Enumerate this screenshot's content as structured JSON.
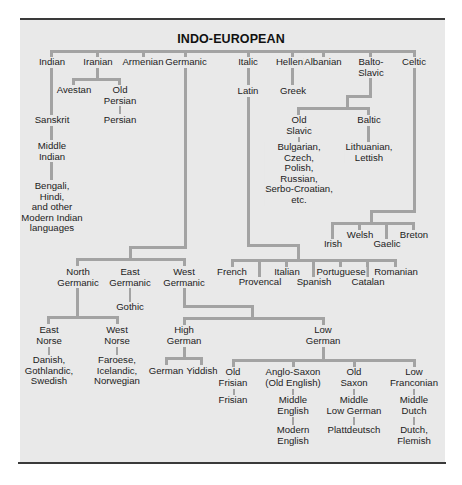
{
  "title": "INDO-EUROPEAN",
  "colors": {
    "background": "#e9e9e9",
    "line": "#a3a3a3",
    "border": "#3a3a3a",
    "text": "#1c1c1c"
  },
  "tree": {
    "indian": {
      "label": "Indian",
      "sanskrit": "Sanskrit",
      "middle_indian": [
        "Middle",
        "Indian"
      ],
      "modern": [
        "Bengali,",
        "Hindi,",
        "and other",
        "Modern Indian",
        "languages"
      ]
    },
    "iranian": {
      "label": "Iranian",
      "avestan": "Avestan",
      "old_persian": [
        "Old",
        "Persian"
      ],
      "persian": "Persian"
    },
    "armenian": {
      "label": "Armenian"
    },
    "germanic": {
      "label": "Germanic",
      "north": {
        "label": [
          "North",
          "Germanic"
        ],
        "east_norse": {
          "label": [
            "East",
            "Norse"
          ],
          "children": [
            "Danish,",
            "Gothlandic,",
            "Swedish"
          ]
        },
        "west_norse": {
          "label": [
            "West",
            "Norse"
          ],
          "children": [
            "Faroese,",
            "Icelandic,",
            "Norwegian"
          ]
        }
      },
      "east": {
        "label": [
          "East",
          "Germanic"
        ],
        "gothic": "Gothic"
      },
      "west": {
        "label": [
          "West",
          "Germanic"
        ],
        "high_german": {
          "label": [
            "High",
            "German"
          ],
          "children": [
            "German",
            "Yiddish"
          ]
        },
        "low_german": {
          "label": [
            "Low",
            "German"
          ],
          "old_frisian": {
            "label": [
              "Old",
              "Frisian"
            ],
            "child": "Frisian"
          },
          "anglo_saxon": {
            "label": [
              "Anglo-Saxon",
              "(Old English)"
            ],
            "middle": [
              "Middle",
              "English"
            ],
            "modern": [
              "Modern",
              "English"
            ]
          },
          "old_saxon": {
            "label": [
              "Old",
              "Saxon"
            ],
            "middle": [
              "Middle",
              "Low German"
            ],
            "modern": "Plattdeutsch"
          },
          "low_franconian": {
            "label": [
              "Low",
              "Franconian"
            ],
            "middle": [
              "Middle",
              "Dutch"
            ],
            "modern": [
              "Dutch,",
              "Flemish"
            ]
          }
        }
      }
    },
    "italic": {
      "label": "Italic",
      "latin": "Latin",
      "romance": [
        "French",
        "Provencal",
        "Italian",
        "Spanish",
        "Portuguese",
        "Catalan",
        "Romanian"
      ]
    },
    "hellenic": {
      "label": "Hellenic",
      "greek": "Greek"
    },
    "albanian": {
      "label": "Albanian"
    },
    "balto_slavic": {
      "label": [
        "Balto-",
        "Slavic"
      ],
      "old_slavic": {
        "label": [
          "Old",
          "Slavic"
        ],
        "children": [
          "Bulgarian,",
          "Czech,",
          "Polish,",
          "Russian,",
          "Serbo-Croatian,",
          "etc."
        ]
      },
      "baltic": {
        "label": "Baltic",
        "children": [
          "Lithuanian,",
          "Lettish"
        ]
      }
    },
    "celtic": {
      "label": "Celtic",
      "children": [
        "Irish",
        "Welsh",
        "Gaelic",
        "Breton"
      ]
    }
  }
}
